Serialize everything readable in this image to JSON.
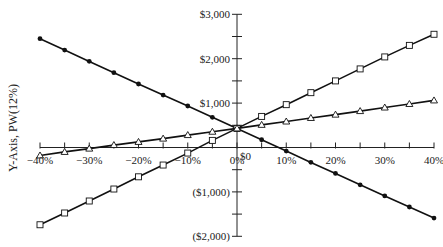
{
  "chart_data": {
    "type": "line",
    "title": "",
    "xlabel": "",
    "ylabel": "Y-Axis, PW(12%)",
    "x": [
      -40,
      -35,
      -30,
      -25,
      -20,
      -15,
      -10,
      -5,
      0,
      5,
      10,
      15,
      20,
      25,
      30,
      35,
      40
    ],
    "x_tick_labels": [
      "-40%",
      "-30%",
      "-20%",
      "-10%",
      "0%",
      "10%",
      "20%",
      "30%",
      "40%"
    ],
    "x_ticks": [
      -40,
      -30,
      -20,
      -10,
      0,
      10,
      20,
      30,
      40
    ],
    "xlim": [
      -40,
      40
    ],
    "y_ticks": [
      3000,
      2000,
      1000,
      0,
      -1000,
      -2000
    ],
    "y_tick_labels": [
      "$3,000",
      "$2,000",
      "$1,000",
      "$0",
      "($1,000)",
      "($2,000)"
    ],
    "ylim": [
      -2000,
      3000
    ],
    "grid": false,
    "legend": null,
    "series": [
      {
        "name": "filled-circle series",
        "marker": "filled-circle",
        "values": [
          2450,
          2195,
          1940,
          1685,
          1430,
          1180,
          935,
          680,
          430,
          175,
          -80,
          -335,
          -585,
          -840,
          -1090,
          -1340,
          -1590
        ]
      },
      {
        "name": "open-square series",
        "marker": "open-square",
        "values": [
          -1740,
          -1475,
          -1205,
          -935,
          -660,
          -395,
          -125,
          160,
          430,
          700,
          965,
          1235,
          1500,
          1770,
          2040,
          2300,
          2550
        ]
      },
      {
        "name": "open-triangle series",
        "marker": "open-triangle",
        "values": [
          -180,
          -100,
          -25,
          55,
          125,
          200,
          280,
          355,
          430,
          510,
          585,
          665,
          740,
          820,
          900,
          980,
          1060
        ]
      }
    ]
  }
}
